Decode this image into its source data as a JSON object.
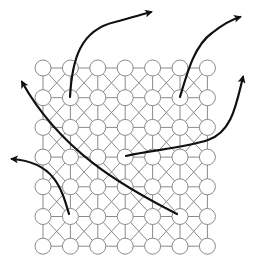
{
  "diagram": {
    "type": "grid-graph-with-flow-arrows",
    "grid": {
      "columns": 7,
      "rows": 7,
      "x_start": 43,
      "x_step": 27.4,
      "y_start": 68,
      "y_step": 29.7,
      "node_radius": 8,
      "connectivity": "orthogonal plus alternating diagonal crosses",
      "edge_color": "#8a8a8a",
      "node_stroke": "#8a8a8a",
      "node_fill": "#ffffff"
    },
    "arrows": [
      {
        "id": "arrow-1",
        "from_node": [
          1,
          1
        ],
        "path": "M70,97 C72,60 80,30 115,22 C130,18 140,15 151,12",
        "color": "#111111"
      },
      {
        "id": "arrow-2",
        "from_node": [
          5,
          1
        ],
        "path": "M180,97 C188,70 195,45 212,33 C222,25 230,20 240,17",
        "color": "#111111"
      },
      {
        "id": "arrow-3",
        "from_node": [
          3,
          3
        ],
        "path": "M126,156 C150,150 185,148 208,140 C232,132 236,105 243,77",
        "color": "#111111"
      },
      {
        "id": "arrow-4",
        "from_node": [
          5,
          5
        ],
        "path": "M177,214 C120,185 60,150 22,82",
        "color": "#111111"
      },
      {
        "id": "arrow-5",
        "from_node": [
          1,
          5
        ],
        "path": "M69,214 C62,190 55,162 12,159",
        "color": "#111111"
      }
    ]
  }
}
